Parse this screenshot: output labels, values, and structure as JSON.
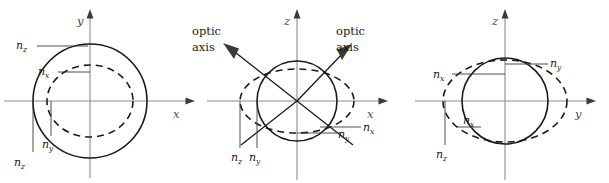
{
  "figure": {
    "colors": {
      "background": "#ffffff",
      "curve": "#1a1a1a",
      "axis": "#8c8c8c",
      "leader": "#3a3a3a"
    }
  },
  "panels": [
    {
      "id": "panel-xy",
      "name": "xy-cross-section",
      "axes": {
        "horizontal": "x",
        "vertical": "y"
      },
      "curves": [
        {
          "style": "solid",
          "name": "circle-nz"
        },
        {
          "style": "dashed",
          "name": "ellipse-nx-ny"
        }
      ],
      "labels": [
        {
          "n": "n",
          "sub": "z",
          "position": "upper-left-outer"
        },
        {
          "n": "n",
          "sub": "x",
          "position": "upper-left-inner"
        },
        {
          "n": "n",
          "sub": "y",
          "position": "lower-left-inner"
        },
        {
          "n": "n",
          "sub": "z",
          "position": "lower-left-outer"
        }
      ]
    },
    {
      "id": "panel-xz",
      "name": "xz-cross-section",
      "axes": {
        "horizontal": "x",
        "vertical": "z"
      },
      "curves": [
        {
          "style": "solid",
          "name": "circle-ny"
        },
        {
          "style": "dashed",
          "name": "ellipse-nx-nz"
        }
      ],
      "optic_axis_label_line1": "optic",
      "optic_axis_label_line2": "axis",
      "optic_axes": [
        {
          "name": "optic-axis-left",
          "direction": "upper-left"
        },
        {
          "name": "optic-axis-right",
          "direction": "upper-right"
        }
      ],
      "labels": [
        {
          "n": "n",
          "sub": "z",
          "position": "bottom-left-outer"
        },
        {
          "n": "n",
          "sub": "y",
          "position": "bottom-left-inner"
        },
        {
          "n": "n",
          "sub": "y",
          "position": "bottom-right-inner"
        },
        {
          "n": "n",
          "sub": "x",
          "position": "bottom-right-outer"
        }
      ]
    },
    {
      "id": "panel-yz",
      "name": "yz-cross-section",
      "axes": {
        "horizontal": "y",
        "vertical": "z"
      },
      "curves": [
        {
          "style": "solid",
          "name": "circle-nx"
        },
        {
          "style": "dashed",
          "name": "ellipse-ny-nz"
        }
      ],
      "labels": [
        {
          "n": "n",
          "sub": "y",
          "position": "upper-right"
        },
        {
          "n": "n",
          "sub": "x",
          "position": "upper-left-outer"
        },
        {
          "n": "n",
          "sub": "x",
          "position": "left-inner"
        },
        {
          "n": "n",
          "sub": "z",
          "position": "lower-left-outer"
        }
      ]
    }
  ]
}
